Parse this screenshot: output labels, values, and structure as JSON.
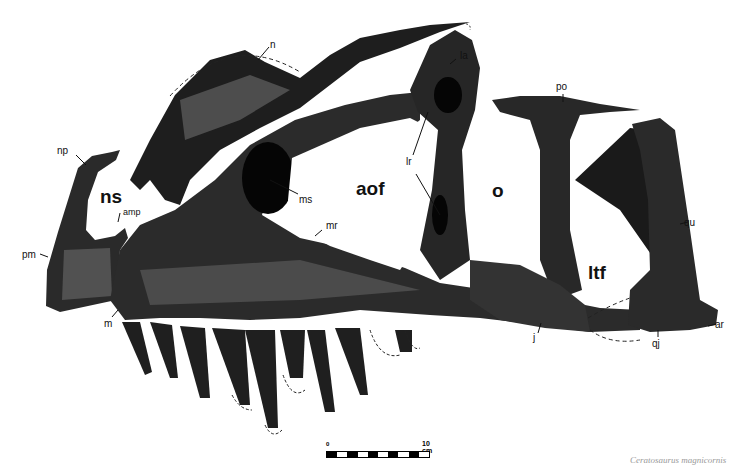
{
  "figure": {
    "caption_partial": "Ceratosaurus magnicornis",
    "colors": {
      "ink": "#111111",
      "paper": "#ffffff",
      "mid": "#444444"
    }
  },
  "labels": {
    "np": "np",
    "ns": "ns",
    "amp": "amp",
    "pm": "pm",
    "m": "m",
    "n": "n",
    "ms": "ms",
    "mr": "mr",
    "aof": "aof",
    "la": "la",
    "lr": "lr",
    "po": "po",
    "o": "o",
    "ltf": "ltf",
    "qu": "qu",
    "j": "j",
    "qj": "qj",
    "ar": "ar"
  },
  "scale_bar": {
    "start_label": "0",
    "end_label": "10 cm",
    "segments": 10
  }
}
